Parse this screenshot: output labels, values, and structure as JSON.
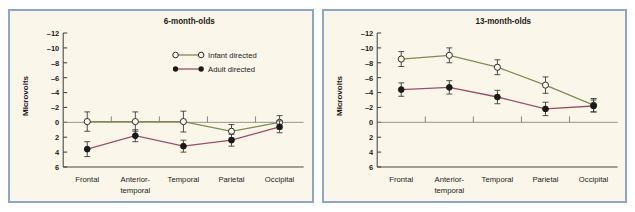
{
  "figure": {
    "background_color": "#ffffff",
    "panel_background_color": "#faf7ea",
    "panel_border_color": "#8aa6c8"
  },
  "legend": {
    "position": "top-right-of-left-panel",
    "entries": [
      {
        "label": "Infant directed",
        "marker": "open-circle",
        "color": "#7d8c4e"
      },
      {
        "label": "Adult directed",
        "marker": "filled-circle",
        "color": "#9c4d6d"
      }
    ]
  },
  "chart_data": [
    {
      "type": "line",
      "title": "6-month-olds",
      "xlabel": "",
      "ylabel": "Microvolts",
      "categories": [
        "Frontal",
        "Anterior-temporal",
        "Temporal",
        "Parietal",
        "Occipital"
      ],
      "category_lines": [
        [
          "Frontal"
        ],
        [
          "Anterior-",
          "temporal"
        ],
        [
          "Temporal"
        ],
        [
          "Parietal"
        ],
        [
          "Occipital"
        ]
      ],
      "ylim": [
        -12,
        6
      ],
      "y_inverted": true,
      "yticks": [
        -12,
        -10,
        -8,
        -6,
        -4,
        -2,
        0,
        2,
        4,
        6
      ],
      "ytick_labels": [
        "–12",
        "–10",
        "–8",
        "–6",
        "–4",
        "–2",
        "0",
        "2",
        "4",
        "6"
      ],
      "grid": false,
      "zero_line": true,
      "series": [
        {
          "name": "Infant directed",
          "color": "#7d8c4e",
          "marker": "open-circle",
          "values": [
            -0.1,
            -0.1,
            -0.1,
            1.2,
            0.0
          ],
          "errors": [
            1.3,
            1.3,
            1.4,
            0.9,
            0.9
          ]
        },
        {
          "name": "Adult directed",
          "color": "#9c4d6d",
          "marker": "filled-circle",
          "values": [
            3.6,
            1.8,
            3.2,
            2.4,
            0.6
          ],
          "errors": [
            1.0,
            0.8,
            0.8,
            0.8,
            0.8
          ]
        }
      ]
    },
    {
      "type": "line",
      "title": "13-month-olds",
      "xlabel": "",
      "ylabel": "Microvolts",
      "categories": [
        "Frontal",
        "Anterior-temporal",
        "Temporal",
        "Parietal",
        "Occipital"
      ],
      "category_lines": [
        [
          "Frontal"
        ],
        [
          "Anterior-",
          "temporal"
        ],
        [
          "Temporal"
        ],
        [
          "Parietal"
        ],
        [
          "Occipital"
        ]
      ],
      "ylim": [
        -12,
        6
      ],
      "y_inverted": true,
      "yticks": [
        -12,
        -10,
        -8,
        -6,
        -4,
        -2,
        0,
        2,
        4,
        6
      ],
      "ytick_labels": [
        "–12",
        "–10",
        "–8",
        "–6",
        "–4",
        "–2",
        "0",
        "2",
        "4",
        "6"
      ],
      "grid": false,
      "zero_line": true,
      "series": [
        {
          "name": "Infant directed",
          "color": "#7d8c4e",
          "marker": "open-circle",
          "values": [
            -8.5,
            -9.0,
            -7.4,
            -5.0,
            -2.3
          ],
          "errors": [
            1.0,
            1.0,
            1.0,
            1.1,
            0.9
          ]
        },
        {
          "name": "Adult directed",
          "color": "#9c4d6d",
          "marker": "filled-circle",
          "values": [
            -4.4,
            -4.7,
            -3.4,
            -1.8,
            -2.2
          ],
          "errors": [
            0.9,
            0.9,
            0.9,
            0.9,
            0.8
          ]
        }
      ]
    }
  ]
}
